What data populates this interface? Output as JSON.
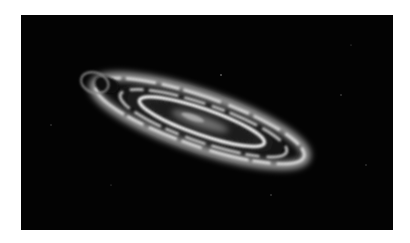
{
  "image": {
    "subject": "spiral galaxy",
    "background_color": "#030303",
    "page_background": "#ffffff",
    "galaxy": {
      "center": [
        179,
        106
      ],
      "tilt_deg": 19,
      "outer_ring": {
        "rx": 110,
        "ry": 26,
        "color": "#cfcfcf"
      },
      "inner_ring": {
        "rx": 68,
        "ry": 14,
        "color": "#e6e6e6"
      },
      "core_color": "#8a8a8a"
    }
  }
}
